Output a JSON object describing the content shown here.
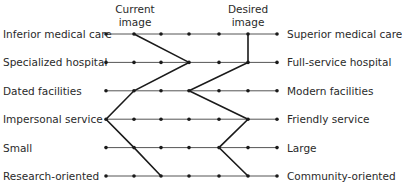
{
  "headers": {
    "current": [
      "Current",
      "image"
    ],
    "desired": [
      "Desired",
      "image"
    ]
  },
  "scale_points": 7,
  "rows": [
    {
      "left": "Inferior medical care",
      "right": "Superior medical care",
      "current": 2,
      "desired": 6
    },
    {
      "left": "Specialized hospital",
      "right": "Full-service hospital",
      "current": 4,
      "desired": 6
    },
    {
      "left": "Dated facilities",
      "right": "Modern facilities",
      "current": 2,
      "desired": 4
    },
    {
      "left": "Impersonal service",
      "right": "Friendly service",
      "current": 1,
      "desired": 6
    },
    {
      "left": "Small",
      "right": "Large",
      "current": 2,
      "desired": 5
    },
    {
      "left": "Research-oriented",
      "right": "Community-oriented",
      "current": 3,
      "desired": 6
    }
  ],
  "colors": {
    "line": "#1a1a1a",
    "text": "#2a2a2a"
  }
}
